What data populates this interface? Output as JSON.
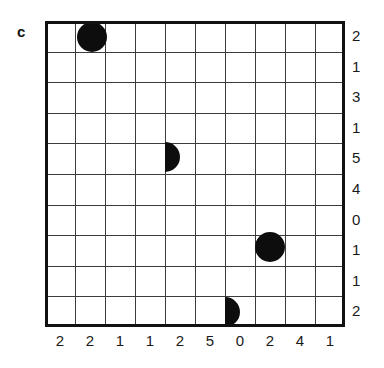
{
  "panel": {
    "label": "c"
  },
  "colors": {
    "ink": "#141414",
    "grid_line": "#3c3c3c",
    "border": "#111111",
    "marker_fill": "#0d0d0d",
    "background": "#ffffff"
  },
  "grid": {
    "columns": 10,
    "rows": 10,
    "cell_size": 30.6,
    "border_width": 3,
    "line_width": 1
  },
  "chart_data": {
    "type": "heatmap",
    "title": "c",
    "xlabel": "",
    "ylabel": "",
    "grid": true,
    "legend": null,
    "columns": 10,
    "rows": 10,
    "column_labels": [
      "2",
      "2",
      "1",
      "1",
      "2",
      "5",
      "0",
      "2",
      "4",
      "1"
    ],
    "row_labels": [
      "2",
      "1",
      "3",
      "1",
      "5",
      "4",
      "0",
      "1",
      "1",
      "2"
    ],
    "markers": [
      {
        "id": "marker-1",
        "shape": "circle",
        "col": 1,
        "row": 0,
        "cx": 92,
        "cy": 37,
        "r": 15,
        "clipped": "top"
      },
      {
        "id": "marker-2",
        "shape": "half-circle-right",
        "col": 3,
        "row": 4,
        "cx": 148,
        "cy": 157,
        "r": 15,
        "clipped": "left"
      },
      {
        "id": "marker-3",
        "shape": "circle",
        "col": 7,
        "row": 7,
        "cx": 270,
        "cy": 247,
        "r": 15,
        "clipped": "none"
      },
      {
        "id": "marker-4",
        "shape": "half-circle-right",
        "col": 5,
        "row": 9,
        "cx": 212,
        "cy": 312,
        "r": 15,
        "clipped": "left-bottom"
      }
    ]
  }
}
